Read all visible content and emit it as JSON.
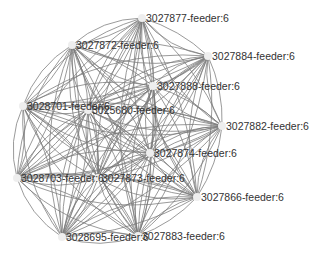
{
  "graph": {
    "type": "network",
    "edge_color": "#7a7a7a",
    "node_color": "#eeeeee",
    "label_color": "#333333",
    "nodes": [
      {
        "id": "3027877",
        "label": "3027877-feeder:6",
        "x": 142,
        "y": 18
      },
      {
        "id": "3027872",
        "label": "3027872-feeder:6",
        "x": 72,
        "y": 45
      },
      {
        "id": "3027884",
        "label": "3027884-feeder:6",
        "x": 208,
        "y": 56
      },
      {
        "id": "3027888",
        "label": "3027888-feeder:6",
        "x": 153,
        "y": 86
      },
      {
        "id": "3028701",
        "label": "3028701-feeder:6",
        "x": 23,
        "y": 106
      },
      {
        "id": "3025680",
        "label": "3025680-feeder:6",
        "x": 88,
        "y": 110
      },
      {
        "id": "3027882",
        "label": "3027882-feeder:6",
        "x": 222,
        "y": 126
      },
      {
        "id": "3027874",
        "label": "3027874-feeder:6",
        "x": 150,
        "y": 153
      },
      {
        "id": "3028703",
        "label": "3028703-feeder:6",
        "x": 17,
        "y": 178
      },
      {
        "id": "3027873",
        "label": "3027873-feeder:6",
        "x": 98,
        "y": 178
      },
      {
        "id": "3027866",
        "label": "3027866-feeder:6",
        "x": 197,
        "y": 197
      },
      {
        "id": "3028695",
        "label": "3028695-feeder:6",
        "x": 62,
        "y": 237
      },
      {
        "id": "3027883",
        "label": "3027883-feeder:6",
        "x": 138,
        "y": 236
      }
    ],
    "fully_connected": true
  }
}
